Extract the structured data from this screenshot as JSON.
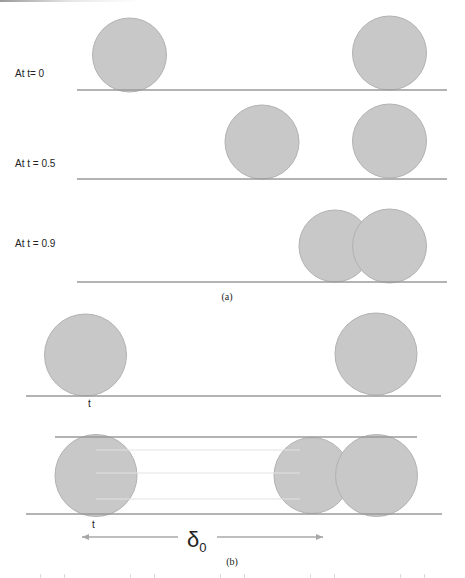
{
  "figure": {
    "colors": {
      "particle_fill": "#c8c8c8",
      "particle_stroke": "#b2b2b2",
      "line": "#9a9a9a",
      "guide_line": "#e2e2e2",
      "text": "#222222"
    },
    "panel_a": {
      "caption": "(a)",
      "rows": [
        {
          "label": "At t= 0",
          "label_pos": [
            15,
            68
          ],
          "baseline": {
            "x1": 77,
            "x2": 447,
            "y": 90
          },
          "particles": [
            {
              "cx": 129.5,
              "cy": 55,
              "r": 37
            },
            {
              "cx": 389.5,
              "cy": 53,
              "r": 37
            }
          ]
        },
        {
          "label": "At t = 0.5",
          "label_pos": [
            15,
            158
          ],
          "baseline": {
            "x1": 77,
            "x2": 447,
            "y": 179
          },
          "particles": [
            {
              "cx": 262,
              "cy": 142,
              "r": 37
            },
            {
              "cx": 389.5,
              "cy": 141,
              "r": 37
            }
          ]
        },
        {
          "label": "At t = 0.9",
          "label_pos": [
            15,
            238
          ],
          "baseline": {
            "x1": 77,
            "x2": 447,
            "y": 282
          },
          "particles": [
            {
              "cx": 335,
              "cy": 246,
              "r": 36
            },
            {
              "cx": 389.5,
              "cy": 246,
              "r": 37
            }
          ]
        }
      ],
      "caption_pos": [
        227,
        291
      ]
    },
    "panel_b": {
      "caption": "(b)",
      "caption_pos": [
        232,
        556
      ],
      "upper": {
        "baseline": {
          "x1": 26,
          "x2": 441,
          "y": 396
        },
        "particles": [
          {
            "cx": 85.5,
            "cy": 355,
            "r": 41
          },
          {
            "cx": 376,
            "cy": 354,
            "r": 41
          }
        ],
        "point_label": "t",
        "point_label_pos": [
          88,
          398
        ]
      },
      "lower": {
        "top_line": {
          "x1": 55,
          "x2": 417,
          "y": 437
        },
        "bottom_line": {
          "x1": 26,
          "x2": 442,
          "y": 514
        },
        "guide_lines": [
          {
            "x1": 96,
            "x2": 300,
            "y": 450
          },
          {
            "x1": 96,
            "x2": 300,
            "y": 473
          },
          {
            "x1": 96,
            "x2": 300,
            "y": 499
          }
        ],
        "particles": [
          {
            "cx": 96,
            "cy": 475.5,
            "r": 41
          },
          {
            "cx": 312,
            "cy": 475.5,
            "r": 38
          },
          {
            "cx": 376.5,
            "cy": 475.5,
            "r": 41
          }
        ],
        "point_label": "t",
        "point_label_pos": [
          92,
          519
        ]
      },
      "distance_arrow": {
        "left": {
          "x1": 178,
          "x2": 82,
          "y": 537
        },
        "right": {
          "x1": 217,
          "x2": 323,
          "y": 537
        },
        "symbol": "δ",
        "subscript": "0",
        "symbol_pos": [
          187,
          527
        ]
      }
    }
  }
}
